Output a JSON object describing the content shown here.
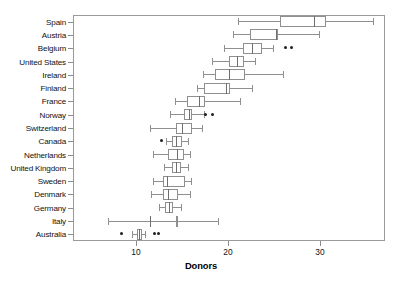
{
  "chart_data": {
    "type": "box",
    "title": "",
    "xlabel": "Donors",
    "ylabel": "",
    "xlim": [
      6.2,
      33.1
    ],
    "ylim": [
      0,
      17
    ],
    "grid": false,
    "legend": null,
    "orientation": "horizontal",
    "xticks": [
      10,
      20,
      30
    ],
    "xticklabels": [
      "10",
      "20",
      "30"
    ],
    "categories": [
      "Spain",
      "Austria",
      "Belgium",
      "United States",
      "Ireland",
      "Finland",
      "France",
      "Norway",
      "Switzerland",
      "Canada",
      "Netherlands",
      "United Kingdom",
      "Sweden",
      "Denmark",
      "Germany",
      "Italy",
      "Australia"
    ],
    "boxes": [
      {
        "category": "Spain",
        "whisker_low": 21.1,
        "q1": 25.6,
        "median": 29.4,
        "q3": 30.7,
        "whisker_high": 35.8,
        "outliers": []
      },
      {
        "category": "Austria",
        "whisker_low": 20.5,
        "q1": 22.4,
        "median": 25.2,
        "q3": 25.4,
        "whisker_high": 29.9,
        "outliers": []
      },
      {
        "category": "Belgium",
        "whisker_low": 19.6,
        "q1": 21.6,
        "median": 22.6,
        "q3": 23.7,
        "whisker_high": 24.9,
        "outliers": [
          26.3,
          26.9
        ]
      },
      {
        "category": "United States",
        "whisker_low": 18.3,
        "q1": 20.1,
        "median": 21.0,
        "q3": 21.7,
        "whisker_high": 22.9,
        "outliers": []
      },
      {
        "category": "Ireland",
        "whisker_low": 17.3,
        "q1": 18.6,
        "median": 20.1,
        "q3": 21.8,
        "whisker_high": 26.0,
        "outliers": []
      },
      {
        "category": "Finland",
        "whisker_low": 16.6,
        "q1": 17.4,
        "median": 19.8,
        "q3": 20.2,
        "whisker_high": 22.6,
        "outliers": []
      },
      {
        "category": "France",
        "whisker_low": 14.2,
        "q1": 15.5,
        "median": 16.9,
        "q3": 17.5,
        "whisker_high": 21.3,
        "outliers": []
      },
      {
        "category": "Norway",
        "whisker_low": 13.7,
        "q1": 15.2,
        "median": 15.8,
        "q3": 16.1,
        "whisker_high": 17.4,
        "outliers": [
          17.6,
          18.3
        ]
      },
      {
        "category": "Switzerland",
        "whisker_low": 11.5,
        "q1": 14.3,
        "median": 15.0,
        "q3": 16.1,
        "whisker_high": 17.2,
        "outliers": []
      },
      {
        "category": "Canada",
        "whisker_low": 13.3,
        "q1": 13.9,
        "median": 14.3,
        "q3": 15.0,
        "whisker_high": 15.7,
        "outliers": [
          12.8
        ]
      },
      {
        "category": "Netherlands",
        "whisker_low": 11.8,
        "q1": 13.5,
        "median": 14.5,
        "q3": 15.2,
        "whisker_high": 15.9,
        "outliers": []
      },
      {
        "category": "United Kingdom",
        "whisker_low": 13.0,
        "q1": 13.9,
        "median": 14.3,
        "q3": 14.9,
        "whisker_high": 15.6,
        "outliers": []
      },
      {
        "category": "Sweden",
        "whisker_low": 11.9,
        "q1": 12.9,
        "median": 13.4,
        "q3": 15.3,
        "whisker_high": 16.0,
        "outliers": []
      },
      {
        "category": "Denmark",
        "whisker_low": 11.6,
        "q1": 12.9,
        "median": 13.5,
        "q3": 14.6,
        "whisker_high": 15.9,
        "outliers": []
      },
      {
        "category": "Germany",
        "whisker_low": 12.5,
        "q1": 13.2,
        "median": 13.6,
        "q3": 14.0,
        "whisker_high": 14.9,
        "outliers": []
      },
      {
        "category": "Italy",
        "whisker_low": 7.0,
        "q1": 14.3,
        "median": 11.5,
        "q3": 14.3,
        "whisker_high": 18.9,
        "outliers": []
      },
      {
        "category": "Australia",
        "whisker_low": 9.6,
        "q1": 10.1,
        "median": 10.3,
        "q3": 10.7,
        "whisker_high": 11.0,
        "outliers": [
          8.4,
          12.0,
          12.4
        ]
      }
    ]
  },
  "axis": {
    "x_title": "Donors"
  }
}
